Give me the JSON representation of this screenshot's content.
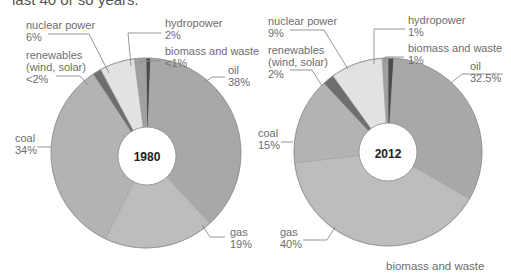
{
  "intro_text": "last 40 or so years.",
  "bottom_text": "biomass and waste",
  "colors": {
    "oil": "#a8a8a8",
    "gas": "#bdbdbd",
    "coal": "#b3b3b3",
    "renewables": "#6e6e6e",
    "nuclear": "#e2e2e2",
    "hydropower": "#a0a0a0",
    "biomass": "#4a4a4a",
    "hole": "#ffffff",
    "edge": "#8e8e8e"
  },
  "chart_data": [
    {
      "type": "pie",
      "title": "1980",
      "donut": true,
      "slices": [
        {
          "key": "biomass",
          "label": "biomass and waste",
          "value_text": "<1%",
          "value": 0.8
        },
        {
          "key": "oil",
          "label": "oil",
          "value_text": "38%",
          "value": 38
        },
        {
          "key": "gas",
          "label": "gas",
          "value_text": "19%",
          "value": 19
        },
        {
          "key": "coal",
          "label": "coal",
          "value_text": "34%",
          "value": 34
        },
        {
          "key": "renewables",
          "label": "renewables (wind, solar)",
          "value_text": "<2%",
          "value": 1.5
        },
        {
          "key": "nuclear",
          "label": "nuclear power",
          "value_text": "6%",
          "value": 6
        },
        {
          "key": "hydropower",
          "label": "hydropower",
          "value_text": "2%",
          "value": 2
        }
      ]
    },
    {
      "type": "pie",
      "title": "2012",
      "donut": true,
      "slices": [
        {
          "key": "biomass",
          "label": "biomass and waste",
          "value_text": "1%",
          "value": 1
        },
        {
          "key": "oil",
          "label": "oil",
          "value_text": "32.5%",
          "value": 32.5
        },
        {
          "key": "gas",
          "label": "gas",
          "value_text": "40%",
          "value": 40
        },
        {
          "key": "coal",
          "label": "coal",
          "value_text": "15%",
          "value": 15
        },
        {
          "key": "renewables",
          "label": "renewables (wind, solar)",
          "value_text": "2%",
          "value": 2
        },
        {
          "key": "nuclear",
          "label": "nuclear power",
          "value_text": "9%",
          "value": 9
        },
        {
          "key": "hydropower",
          "label": "hydropower",
          "value_text": "1%",
          "value": 1
        }
      ]
    }
  ],
  "labels_1980": {
    "nuclear": {
      "name": "nuclear power",
      "pct": "6%"
    },
    "renewables": {
      "name1": "renewables",
      "name2": "(wind, solar)",
      "pct": "<2%"
    },
    "hydropower": {
      "name": "hydropower",
      "pct": "2%"
    },
    "biomass": {
      "name": "biomass and waste",
      "pct": "<1%"
    },
    "oil": {
      "name": "oil",
      "pct": "38%"
    },
    "coal": {
      "name": "coal",
      "pct": "34%"
    },
    "gas": {
      "name": "gas",
      "pct": "19%"
    },
    "year": "1980"
  },
  "labels_2012": {
    "nuclear": {
      "name": "nuclear power",
      "pct": "9%"
    },
    "renewables": {
      "name1": "renewables",
      "name2": "(wind, solar)",
      "pct": "2%"
    },
    "hydropower": {
      "name": "hydropower",
      "pct": "1%"
    },
    "biomass": {
      "name": "biomass and waste",
      "pct": "1%"
    },
    "oil": {
      "name": "oil",
      "pct": "32.5%"
    },
    "coal": {
      "name": "coal",
      "pct": "15%"
    },
    "gas": {
      "name": "gas",
      "pct": "40%"
    },
    "year": "2012"
  }
}
